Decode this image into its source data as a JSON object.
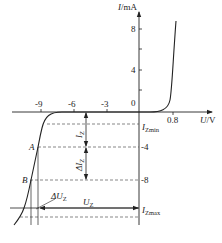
{
  "diagram": {
    "y_axis": {
      "label_var": "I",
      "label_unit": "/mA",
      "ticks": [
        "8",
        "4",
        "0",
        "-4",
        "-8"
      ]
    },
    "x_axis": {
      "label_var": "U",
      "label_unit": "/V",
      "ticks": [
        "-9",
        "-6",
        "-3",
        "0.8"
      ]
    },
    "points": {
      "a": "A",
      "b": "B"
    },
    "annotations": {
      "iz_main": "I",
      "iz_sub": "Z",
      "delta_iz_main": "ΔI",
      "delta_iz_sub": "Z",
      "delta_uz_main": "ΔU",
      "delta_uz_sub": "Z",
      "uz_main": "U",
      "uz_sub": "Z",
      "izmin_main": "I",
      "izmin_sub": "Zmin",
      "izmax_main": "I",
      "izmax_sub": "Zmax"
    },
    "colors": {
      "line": "#222222",
      "dash": "#555555",
      "background": "#ffffff"
    }
  }
}
